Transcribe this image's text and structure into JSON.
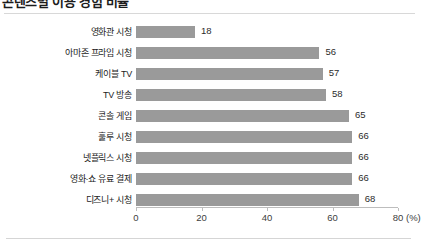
{
  "figure": {
    "title": "콘텐츠별 이용 경험 비율",
    "title_truncated": true
  },
  "chart_data": {
    "type": "bar",
    "orientation": "horizontal",
    "title": "콘텐츠별 이용 경험 비율",
    "xlabel": "(%)",
    "ylabel": "",
    "xlim": [
      0,
      80
    ],
    "xticks": [
      0,
      20,
      40,
      60,
      80
    ],
    "xtick_labels": [
      "0",
      "20",
      "40",
      "60",
      "80"
    ],
    "unit_label": "(%)",
    "grid": false,
    "legend": false,
    "bar_color": "#9a9a9a",
    "categories": [
      "영화관 시청",
      "아마존 프라임 시청",
      "케이블 TV",
      "TV 방송",
      "콘솔 게임",
      "훌루 시청",
      "넷플릭스 시청",
      "영화·쇼 유료 결제",
      "디즈니+ 시청"
    ],
    "values": [
      18,
      56,
      57,
      58,
      65,
      66,
      66,
      66,
      68
    ],
    "value_labels": [
      "18",
      "56",
      "57",
      "58",
      "65",
      "66",
      "66",
      "66",
      "68"
    ]
  }
}
